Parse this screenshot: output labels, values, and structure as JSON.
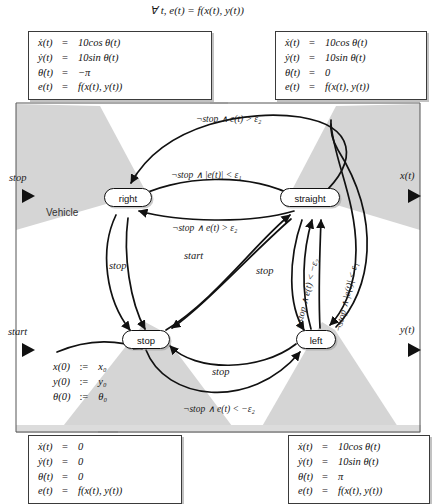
{
  "figure": {
    "top_formula": "∀ t, e(t) = f(x(t), y(t))",
    "container_label": "Vehicle"
  },
  "ports": {
    "inputs": [
      {
        "name": "stop-input-port",
        "label": "stop"
      },
      {
        "name": "start-input-port",
        "label": "start"
      }
    ],
    "outputs": [
      {
        "name": "x-output-port",
        "label": "x(t)"
      },
      {
        "name": "y-output-port",
        "label": "y(t)"
      }
    ]
  },
  "states": [
    {
      "id": "right",
      "label": "right"
    },
    {
      "id": "straight",
      "label": "straight"
    },
    {
      "id": "stop",
      "label": "stop"
    },
    {
      "id": "left",
      "label": "left"
    }
  ],
  "init_block": {
    "rows": [
      {
        "lhs": "x(0)",
        "op": ":=",
        "rhs": "x₀"
      },
      {
        "lhs": "y(0)",
        "op": ":=",
        "rhs": "y₀"
      },
      {
        "lhs": "θ(0)",
        "op": ":=",
        "rhs": "θ₀"
      }
    ]
  },
  "equation_boxes": [
    {
      "id": "right-equations",
      "position": "top-left",
      "rows": [
        {
          "lhs": "ẋ(t)",
          "op": "=",
          "rhs": "10cos θ(t)"
        },
        {
          "lhs": "ẏ(t)",
          "op": "=",
          "rhs": "10sin θ(t)"
        },
        {
          "lhs": "θ̇(t)",
          "op": "=",
          "rhs": "−π"
        },
        {
          "lhs": "e(t)",
          "op": "=",
          "rhs": "f(x(t), y(t))"
        }
      ]
    },
    {
      "id": "straight-equations",
      "position": "top-right",
      "rows": [
        {
          "lhs": "ẋ(t)",
          "op": "=",
          "rhs": "10cos θ(t)"
        },
        {
          "lhs": "ẏ(t)",
          "op": "=",
          "rhs": "10sin θ(t)"
        },
        {
          "lhs": "θ̇(t)",
          "op": "=",
          "rhs": "0"
        },
        {
          "lhs": "e(t)",
          "op": "=",
          "rhs": "f(x(t), y(t))"
        }
      ]
    },
    {
      "id": "stop-equations",
      "position": "bottom-left",
      "rows": [
        {
          "lhs": "ẋ(t)",
          "op": "=",
          "rhs": "0"
        },
        {
          "lhs": "ẏ(t)",
          "op": "=",
          "rhs": "0"
        },
        {
          "lhs": "θ̇(t)",
          "op": "=",
          "rhs": "0"
        },
        {
          "lhs": "e(t)",
          "op": "=",
          "rhs": "f(x(t), y(t))"
        }
      ]
    },
    {
      "id": "left-equations",
      "position": "bottom-right",
      "rows": [
        {
          "lhs": "ẋ(t)",
          "op": "=",
          "rhs": "10cos θ(t)"
        },
        {
          "lhs": "ẏ(t)",
          "op": "=",
          "rhs": "10sin θ(t)"
        },
        {
          "lhs": "θ̇(t)",
          "op": "=",
          "rhs": "π"
        },
        {
          "lhs": "e(t)",
          "op": "=",
          "rhs": "f(x(t), y(t))"
        }
      ]
    }
  ],
  "transitions": [
    {
      "id": "t-straight-right-outer",
      "label": "¬stop ∧ e(t) > ε₂"
    },
    {
      "id": "t-right-straight",
      "label": "¬stop ∧ |e(t)| < ε₁"
    },
    {
      "id": "t-straight-right-inner",
      "label": "¬stop ∧ e(t) > ε₂"
    },
    {
      "id": "t-right-stop",
      "label": "stop"
    },
    {
      "id": "t-right-stop-2",
      "label": "stop"
    },
    {
      "id": "t-stop-straight",
      "label": "start"
    },
    {
      "id": "t-straight-stop",
      "label": "stop"
    },
    {
      "id": "t-stop-left",
      "label": "stop"
    },
    {
      "id": "t-straight-left",
      "label": "¬stop ∧ e(t) < −ε₂"
    },
    {
      "id": "t-left-straight",
      "label": "¬stop ∧ |e(t)| < ε₁"
    },
    {
      "id": "t-stop-left-bottom",
      "label": "¬stop ∧ e(t) < −ε₂"
    }
  ],
  "colors": {
    "ink": "#111111",
    "shade": "#d4d4d4",
    "box_border": "#3a3a3a",
    "background": "#ffffff"
  }
}
